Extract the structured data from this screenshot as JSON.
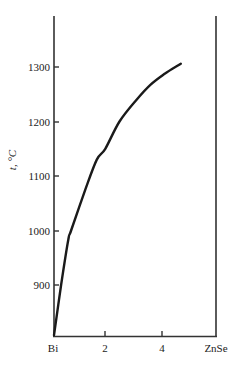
{
  "chart_data": {
    "type": "line",
    "title": "",
    "xlabel": "",
    "ylabel": "t, °C",
    "x_tick_labels": [
      "Bi",
      "2",
      "4",
      "ZnSe"
    ],
    "x_ticks": [
      0,
      2,
      4,
      5.7
    ],
    "y_tick_labels": [
      "900",
      "1000",
      "1100",
      "1200",
      "1300"
    ],
    "y_ticks": [
      900,
      1000,
      1100,
      1200,
      1300
    ],
    "xlim": [
      0,
      5.7
    ],
    "ylim": [
      808,
      1390
    ],
    "grid": false,
    "legend": null,
    "series": [
      {
        "name": "liquidus",
        "x": [
          0.0,
          0.25,
          0.5,
          0.6,
          1.1,
          1.5,
          1.8,
          2.3,
          2.9,
          3.4,
          3.9,
          4.45
        ],
        "y": [
          808,
          900,
          983,
          1000,
          1075,
          1130,
          1150,
          1200,
          1240,
          1268,
          1288,
          1306
        ]
      }
    ]
  },
  "labels": {
    "y_axis": "t, °C",
    "x_left": "Bi",
    "x_2": "2",
    "x_4": "4",
    "x_right": "ZnSe",
    "y_900": "900",
    "y_1000": "1000",
    "y_1100": "1100",
    "y_1200": "1200",
    "y_1300": "1300"
  },
  "colors": {
    "line": "#1a1a1a",
    "axis": "#333333",
    "background": "#ffffff"
  }
}
